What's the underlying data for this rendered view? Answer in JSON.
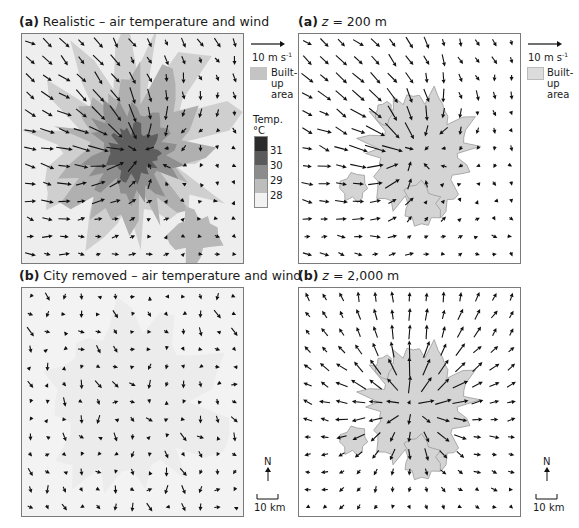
{
  "panels": [
    {
      "id": "a-left",
      "label": "(a)",
      "title": "Realistic – air temperature and wind",
      "background": "temperature"
    },
    {
      "id": "a-right",
      "label": "(a)",
      "title_z": "z",
      "title_rest": " = 200 m",
      "background": "built-up"
    },
    {
      "id": "b-left",
      "label": "(b)",
      "title": "City removed – air temperature and wind",
      "background": "temperature-faint"
    },
    {
      "id": "b-right",
      "label": "(b)",
      "title_z": "z",
      "title_rest": " = 2,000 m",
      "background": "built-up"
    }
  ],
  "legend": {
    "wind_scale": "10 m s",
    "wind_scale_sup": "-1",
    "builtup_line1": "Built-",
    "builtup_line2": "up",
    "builtup_line3": "area",
    "temp_title": "Temp.",
    "temp_unit": "°C",
    "temp_ticks": [
      "31",
      "30",
      "29",
      "28"
    ],
    "temp_colors": [
      "#2b2b2b",
      "#5a5a5a",
      "#8c8c8c",
      "#bdbdbd",
      "#f2f2f2"
    ],
    "north_label": "N",
    "scale_bar": "10 km"
  },
  "colors": {
    "builtup": "#d4d4d4",
    "builtup_edge": "#9a9a9a",
    "arrow": "#111111",
    "frame": "#7a7a7a"
  }
}
